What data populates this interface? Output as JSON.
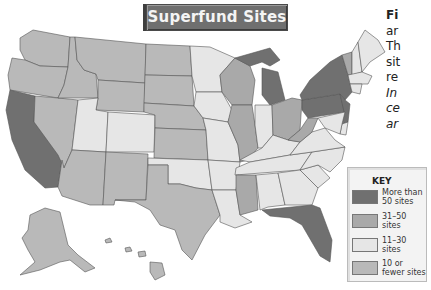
{
  "title": "Superfund Sites",
  "caption_lines": [
    {
      "text": "Fi",
      "style": "bold"
    },
    {
      "text": "ar",
      "style": "normal"
    },
    {
      "text": "Th",
      "style": "normal"
    },
    {
      "text": "sit",
      "style": "normal"
    },
    {
      "text": "re",
      "style": "normal"
    },
    {
      "text": "In",
      "style": "ital"
    },
    {
      "text": "ce",
      "style": "ital"
    },
    {
      "text": "ar",
      "style": "ital"
    }
  ],
  "key": {
    "title": "KEY",
    "entries": [
      {
        "id": "more_than_50",
        "label": "More than\n50 sites",
        "color": "#707070"
      },
      {
        "id": "31_50",
        "label": "31–50\nsites",
        "color": "#a9a9a9"
      },
      {
        "id": "11_30",
        "label": "11–30\nsites",
        "color": "#e6e6e6"
      },
      {
        "id": "10_or_fewer",
        "label": "10 or\nfewer sites",
        "color": "#b9b9b9"
      }
    ]
  },
  "states": {
    "WA": "10_or_fewer",
    "OR": "10_or_fewer",
    "CA": "more_than_50",
    "NV": "10_or_fewer",
    "ID": "10_or_fewer",
    "MT": "10_or_fewer",
    "WY": "10_or_fewer",
    "UT": "11_30",
    "CO": "11_30",
    "AZ": "10_or_fewer",
    "NM": "10_or_fewer",
    "ND": "10_or_fewer",
    "SD": "10_or_fewer",
    "NE": "10_or_fewer",
    "KS": "10_or_fewer",
    "OK": "11_30",
    "TX": "10_or_fewer",
    "MN": "11_30",
    "IA": "11_30",
    "MO": "11_30",
    "AR": "11_30",
    "LA": "11_30",
    "WI": "31_50",
    "IL": "31_50",
    "MI": "more_than_50",
    "IN": "11_30",
    "OH": "31_50",
    "KY": "11_30",
    "TN": "11_30",
    "MS": "31_50",
    "AL": "11_30",
    "GA": "11_30",
    "FL": "more_than_50",
    "SC": "11_30",
    "NC": "11_30",
    "VA": "11_30",
    "WV": "31_50",
    "PA": "more_than_50",
    "NY": "more_than_50",
    "NJ": "more_than_50",
    "VT": "31_50",
    "NH": "11_30",
    "ME": "11_30",
    "MA": "11_30",
    "CT": "11_30",
    "MD": "11_30",
    "DE": "11_30",
    "AK": "10_or_fewer",
    "HI": "10_or_fewer"
  }
}
